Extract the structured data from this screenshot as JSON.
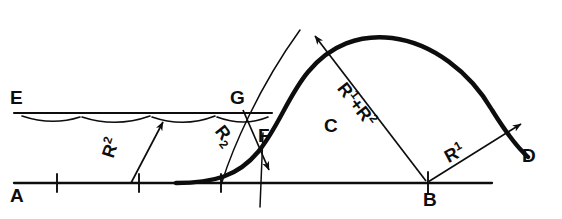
{
  "figure": {
    "type": "engineering-geometry-diagram",
    "ink_color": "#0d0d0d",
    "background_color": "#ffffff",
    "width": 562,
    "height": 219
  },
  "points": [
    {
      "id": "E",
      "label": "E",
      "x": 14,
      "y": 103,
      "role": "upper-straight-line-start-marker"
    },
    {
      "id": "G",
      "label": "G",
      "x": 236,
      "y": 103,
      "role": "tangent-point-on-upper-line"
    },
    {
      "id": "F",
      "label": "F",
      "x": 262,
      "y": 135,
      "role": "curve-junction-point"
    },
    {
      "id": "C",
      "label": "C",
      "x": 328,
      "y": 126,
      "role": "curve-interior-label"
    },
    {
      "id": "B",
      "label": "B",
      "x": 428,
      "y": 190,
      "role": "center-point-on-baseline"
    },
    {
      "id": "D",
      "label": "D",
      "x": 527,
      "y": 157,
      "role": "curve-end-point"
    },
    {
      "id": "A",
      "label": "A",
      "x": 14,
      "y": 197,
      "role": "baseline-start-marker"
    }
  ],
  "dimension_labels": [
    {
      "id": "r2-left",
      "text": "R",
      "sup": "2",
      "x": 118,
      "y": 155,
      "rotation": -72,
      "note": "radius R2 on left arc"
    },
    {
      "id": "r2-right",
      "text": "R",
      "sub": "2",
      "x": 228,
      "y": 148,
      "rotation": 52,
      "note": "radius R2 near G-F"
    },
    {
      "id": "r1-plus-r2",
      "text": "R",
      "sup": "1",
      "plus": "+",
      "text2": "R",
      "sup2": "2",
      "x": 352,
      "y": 90,
      "rotation": 52,
      "note": "distance R1 + R2 from B to arc centre"
    },
    {
      "id": "r1-right",
      "text": "R",
      "sup": "1",
      "x": 452,
      "y": 148,
      "rotation": -28,
      "note": "radius R1 from B to D"
    }
  ],
  "lines": [
    {
      "id": "upper-line-E-G",
      "name": "line-E",
      "from": [
        14,
        113
      ],
      "to": [
        272,
        113
      ],
      "weight": "medium"
    },
    {
      "id": "baseline-A-B",
      "name": "line-A",
      "from": [
        14,
        183
      ],
      "to": [
        492,
        183
      ],
      "weight": "medium"
    }
  ],
  "tick_marks": [
    {
      "on": "baseline",
      "x": 57
    },
    {
      "on": "baseline",
      "x": 139
    },
    {
      "on": "baseline",
      "x": 221
    },
    {
      "on": "baseline",
      "x": 428
    }
  ],
  "scallops": {
    "name": "hatch-scallop-arcs-under-line-E",
    "count": 4,
    "y": 113,
    "spans": [
      [
        22,
        80
      ],
      [
        80,
        150
      ],
      [
        150,
        215
      ],
      [
        215,
        268
      ]
    ]
  },
  "arrows": [
    {
      "id": "arrow-r2-left",
      "name": "dimension-arrow-r2-left",
      "from": [
        131,
        183
      ],
      "to": [
        163,
        120
      ],
      "heads": "end"
    },
    {
      "id": "arrow-r2-right",
      "name": "dimension-arrow-r2-right",
      "from": [
        243,
        110
      ],
      "to": [
        270,
        171
      ],
      "heads": "end"
    },
    {
      "id": "arrow-r1r2",
      "name": "dimension-arrow-r1-plus-r2",
      "from": [
        425,
        181
      ],
      "to": [
        318,
        38
      ],
      "heads": "end"
    },
    {
      "id": "arrow-r1",
      "name": "dimension-arrow-r1",
      "from": [
        428,
        183
      ],
      "to": [
        521,
        125
      ],
      "heads": "end"
    }
  ],
  "curves": [
    {
      "id": "main-transition-curve",
      "name": "thick-reverse-curve-F-to-D",
      "weight": "thick"
    },
    {
      "id": "construction-arc-G",
      "name": "thin-construction-arc-through-G",
      "weight": "thin"
    },
    {
      "id": "construction-vertical-F",
      "name": "thin-vertical-line-at-F",
      "weight": "thin"
    }
  ]
}
